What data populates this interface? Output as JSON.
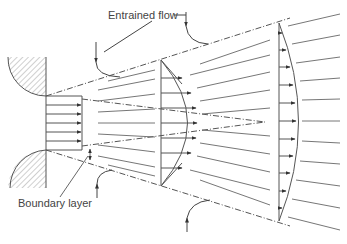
{
  "figure": {
    "labels": {
      "entrained_flow": "Entrained flow",
      "boundary_layer": "Boundary layer"
    },
    "colors": {
      "line": "#555555",
      "hatch": "#777777",
      "background": "#ffffff"
    },
    "elements": {
      "nozzle_walls": 2,
      "velocity_profiles": 3,
      "profile_arrow_counts": [
        5,
        7,
        11
      ],
      "entrainment_arrows": 4
    }
  }
}
